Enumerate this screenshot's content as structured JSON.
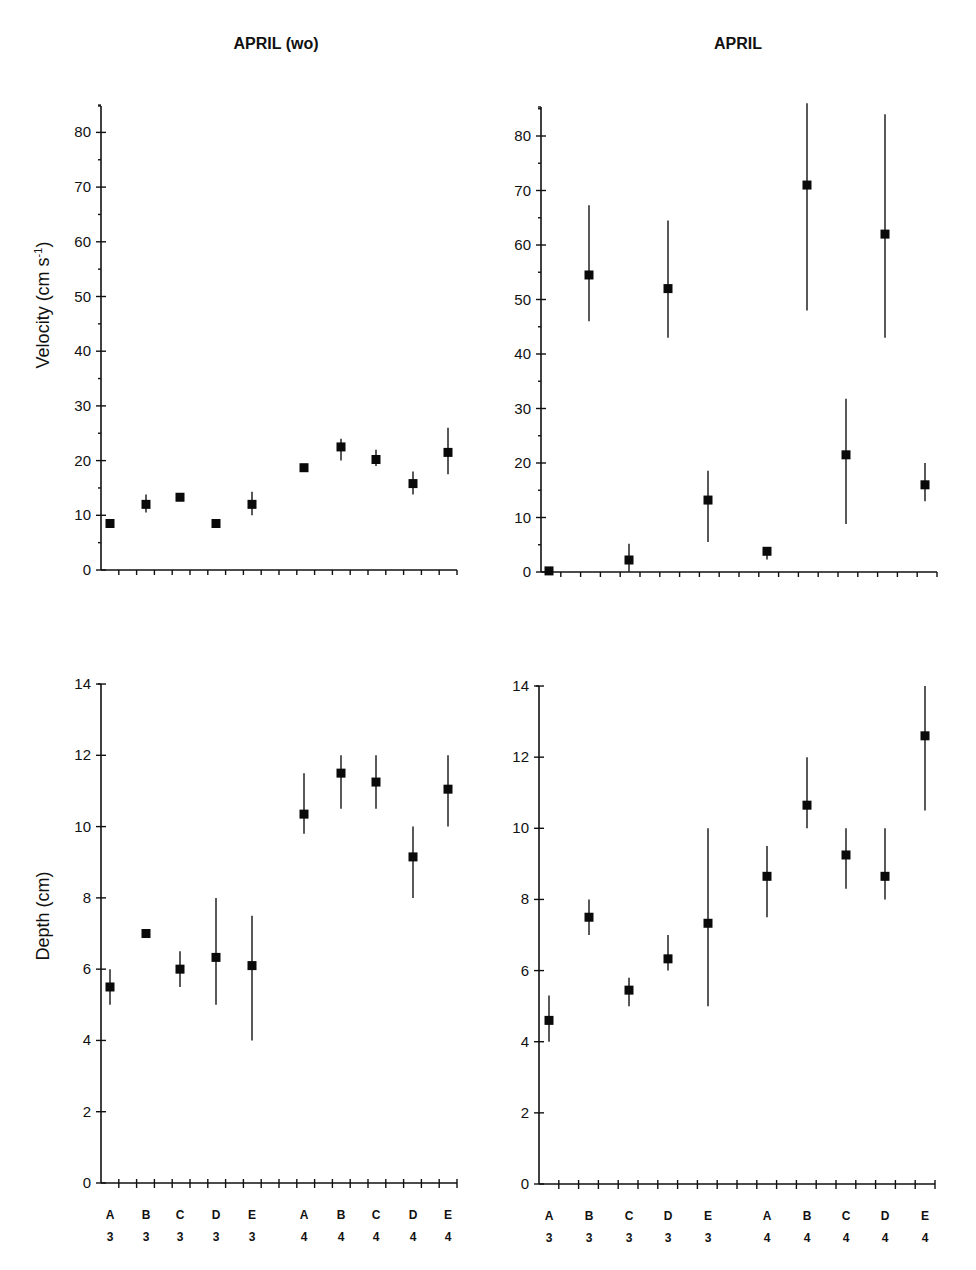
{
  "figure": {
    "column_titles": [
      "APRIL (wo)",
      "APRIL"
    ],
    "category_letters": [
      "A",
      "B",
      "C",
      "D",
      "E",
      "A",
      "B",
      "C",
      "D",
      "E"
    ],
    "category_numbers": [
      "3",
      "3",
      "3",
      "3",
      "3",
      "4",
      "4",
      "4",
      "4",
      "4"
    ],
    "velocity_ylabel": "Velocity (cm s",
    "velocity_ylabel_sup": "-1",
    "velocity_ylabel_close": ")",
    "depth_ylabel": "Depth (cm)",
    "velocity_ticks": [
      "0",
      "10",
      "20",
      "30",
      "40",
      "50",
      "60",
      "70",
      "80"
    ],
    "depth_ticks": [
      "0",
      "2",
      "4",
      "6",
      "8",
      "10",
      "12",
      "14"
    ],
    "colors": {
      "marker": "#0a0a0a",
      "axis": "#111111",
      "background": "#ffffff"
    }
  },
  "chart_data": [
    {
      "type": "scatter",
      "title": "APRIL (wo)",
      "panel": "top-left",
      "xlabel": "",
      "ylabel": "Velocity (cm s-1)",
      "categories": [
        "A3",
        "B3",
        "C3",
        "D3",
        "E3",
        "A4",
        "B4",
        "C4",
        "D4",
        "E4"
      ],
      "values": [
        8.5,
        12.0,
        13.3,
        8.5,
        12.0,
        18.7,
        22.5,
        20.2,
        15.8,
        21.5
      ],
      "error_low": [
        8.5,
        10.5,
        13.3,
        8.5,
        10.0,
        18.7,
        20.0,
        19.0,
        13.8,
        17.5
      ],
      "error_high": [
        8.5,
        13.8,
        13.3,
        8.5,
        14.3,
        18.7,
        24.0,
        22.0,
        18.0,
        26.0
      ],
      "ylim": [
        0,
        85
      ],
      "yticks": [
        0,
        10,
        20,
        30,
        40,
        50,
        60,
        70,
        80
      ],
      "grid": false
    },
    {
      "type": "scatter",
      "title": "APRIL",
      "panel": "top-right",
      "xlabel": "",
      "ylabel": "Velocity (cm s-1)",
      "categories": [
        "A3",
        "B3",
        "C3",
        "D3",
        "E3",
        "A4",
        "B4",
        "C4",
        "D4",
        "E4"
      ],
      "values": [
        0.2,
        54.5,
        2.2,
        52.0,
        13.2,
        3.8,
        71.0,
        21.5,
        62.0,
        16.0
      ],
      "error_low": [
        0.2,
        46.0,
        0.0,
        43.0,
        5.5,
        2.3,
        48.0,
        8.8,
        43.0,
        13.0
      ],
      "error_high": [
        0.2,
        67.3,
        5.2,
        64.5,
        18.6,
        3.8,
        86.0,
        31.8,
        84.0,
        20.0
      ],
      "ylim": [
        0,
        85
      ],
      "yticks": [
        0,
        10,
        20,
        30,
        40,
        50,
        60,
        70,
        80
      ],
      "grid": false
    },
    {
      "type": "scatter",
      "title": "APRIL (wo)",
      "panel": "bottom-left",
      "xlabel": "",
      "ylabel": "Depth (cm)",
      "categories": [
        "A3",
        "B3",
        "C3",
        "D3",
        "E3",
        "A4",
        "B4",
        "C4",
        "D4",
        "E4"
      ],
      "values": [
        5.5,
        7.0,
        6.0,
        6.33,
        6.1,
        10.35,
        11.5,
        11.25,
        9.15,
        11.05
      ],
      "error_low": [
        5.0,
        7.0,
        5.5,
        5.0,
        4.0,
        9.8,
        10.5,
        10.5,
        8.0,
        10.0
      ],
      "error_high": [
        6.0,
        7.0,
        6.5,
        8.0,
        7.5,
        11.5,
        12.0,
        12.0,
        10.0,
        12.0
      ],
      "ylim": [
        0,
        14
      ],
      "yticks": [
        0,
        2,
        4,
        6,
        8,
        10,
        12,
        14
      ],
      "grid": false
    },
    {
      "type": "scatter",
      "title": "APRIL",
      "panel": "bottom-right",
      "xlabel": "",
      "ylabel": "Depth (cm)",
      "categories": [
        "A3",
        "B3",
        "C3",
        "D3",
        "E3",
        "A4",
        "B4",
        "C4",
        "D4",
        "E4"
      ],
      "values": [
        4.6,
        7.5,
        5.45,
        6.33,
        7.33,
        8.65,
        10.65,
        9.25,
        8.65,
        12.6
      ],
      "error_low": [
        4.0,
        7.0,
        5.0,
        6.0,
        5.0,
        7.5,
        10.0,
        8.3,
        8.0,
        10.5
      ],
      "error_high": [
        5.3,
        8.0,
        5.8,
        7.0,
        10.0,
        9.5,
        12.0,
        10.0,
        10.0,
        14.0
      ],
      "ylim": [
        0,
        14
      ],
      "yticks": [
        0,
        2,
        4,
        6,
        8,
        10,
        12,
        14
      ],
      "grid": false
    }
  ]
}
